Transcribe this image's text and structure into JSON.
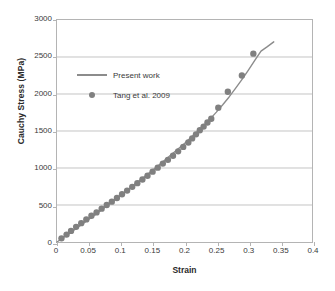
{
  "figure": {
    "caption": ""
  },
  "chart_data": {
    "type": "scatter",
    "title": "",
    "xlabel": "Strain",
    "ylabel": "Cauchy Stress (MPa)",
    "xlim": [
      0,
      0.4
    ],
    "ylim": [
      0,
      3000
    ],
    "xticks": [
      "0",
      "0.05",
      "0.1",
      "0.15",
      "0.2",
      "0.25",
      "0.3",
      "0.35",
      "0.4"
    ],
    "xtick_values": [
      0,
      0.05,
      0.1,
      0.15,
      0.2,
      0.25,
      0.3,
      0.35,
      0.4
    ],
    "yticks": [
      "0",
      "500",
      "1000",
      "1500",
      "2000",
      "2500",
      "3000"
    ],
    "ytick_values": [
      0,
      500,
      1000,
      1500,
      2000,
      2500,
      3000
    ],
    "grid": "horizontal",
    "legend_position": "upper-left-inside",
    "marker_color": "#808080",
    "line_color": "#8c8c8c",
    "axis_color": "#b4b4b4",
    "grid_color": "#c3c3c3",
    "series": [
      {
        "name": "Present work",
        "type": "line",
        "color": "#8c8c8c",
        "x": [
          0.0,
          0.02,
          0.04,
          0.06,
          0.08,
          0.1,
          0.12,
          0.14,
          0.16,
          0.18,
          0.2,
          0.22,
          0.24,
          0.25,
          0.26,
          0.27,
          0.28,
          0.29,
          0.3,
          0.31,
          0.32,
          0.33,
          0.34
        ],
        "y": [
          0,
          120,
          245,
          370,
          500,
          630,
          765,
          900,
          1040,
          1185,
          1330,
          1490,
          1660,
          1755,
          1855,
          1960,
          2075,
          2195,
          2320,
          2450,
          2580,
          2640,
          2705
        ]
      },
      {
        "name": "Tang et al. 2009",
        "type": "scatter",
        "color": "#808080",
        "x": [
          0.007,
          0.015,
          0.022,
          0.03,
          0.038,
          0.046,
          0.054,
          0.062,
          0.07,
          0.078,
          0.086,
          0.094,
          0.102,
          0.11,
          0.118,
          0.126,
          0.134,
          0.142,
          0.15,
          0.158,
          0.166,
          0.174,
          0.182,
          0.19,
          0.198,
          0.206,
          0.212,
          0.218,
          0.224,
          0.23,
          0.236,
          0.242,
          0.253,
          0.268,
          0.29,
          0.308
        ],
        "y": [
          50,
          100,
          150,
          205,
          255,
          305,
          355,
          400,
          450,
          500,
          545,
          595,
          645,
          695,
          745,
          795,
          845,
          895,
          950,
          1005,
          1060,
          1110,
          1165,
          1225,
          1285,
          1345,
          1400,
          1455,
          1510,
          1560,
          1615,
          1665,
          1815,
          2030,
          2250,
          2545
        ]
      }
    ]
  },
  "legend": {
    "items": [
      {
        "label": "Present work",
        "key": "line-key"
      },
      {
        "label": "Tang et al. 2009",
        "key": "dot-key"
      }
    ]
  }
}
